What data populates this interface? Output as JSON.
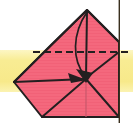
{
  "figure": {
    "width": 133,
    "height": 123,
    "background_color": "#ffffff",
    "caption": ""
  },
  "colors": {
    "paper_front": "#f4687d",
    "paper_front_shade": "#ef5b72",
    "paper_stripe": "#e85c72",
    "fold_line": "#231f20",
    "crease_dashed": "#231f20",
    "arrow": "#231f20",
    "highlight_band": "#f7e98a",
    "highlight_band_soft": "#faf0ab",
    "edge_rule": "#3a2f1e",
    "white": "#ffffff"
  },
  "highlight_band": {
    "name": "yellow-horizontal-band",
    "x": 0,
    "y": 50,
    "width": 133,
    "height": 42,
    "color": "#f7e98a"
  },
  "right_rule": {
    "name": "vertical-edge-rule",
    "x": 119,
    "y_top": 0,
    "y_bottom": 123,
    "color": "#3a2f1e",
    "width": 1.4
  },
  "paper": {
    "name": "folded-paper-body",
    "fill": "#f4687d",
    "stroke": "#231f20",
    "stroke_width": 2,
    "points": "87,10 119,42 119,117 42,117 14,82 51,45"
  },
  "fold_lines": [
    {
      "name": "crease-apex-to-left-vertex",
      "style": "solid",
      "points": "87,10 14,82"
    },
    {
      "name": "crease-apex-to-right-edge",
      "style": "solid",
      "points": "87,10 119,42"
    },
    {
      "name": "crease-apex-vertical-to-center",
      "style": "solid",
      "points": "87,11 86,78"
    },
    {
      "name": "crease-left-vertex-to-center",
      "style": "solid",
      "points": "14,82 86,79"
    },
    {
      "name": "crease-center-to-right-upper",
      "style": "solid",
      "points": "86,78 119,52"
    },
    {
      "name": "crease-center-to-bottom-left",
      "style": "solid",
      "points": "86,79 42,117"
    },
    {
      "name": "crease-center-to-bottom-right",
      "style": "solid",
      "points": "86,79 119,117"
    },
    {
      "name": "crease-center-vertical-to-bottom",
      "style": "solid-light",
      "points": "86,80 86,117"
    }
  ],
  "dashed_crease": {
    "name": "valley-fold-dashed-line",
    "style": "dashed",
    "points": "33,52 129,52",
    "dash_pattern": "7 4"
  },
  "motion_arc": {
    "name": "fold-motion-curved-arrow",
    "path": "M 87,12 C 72,34 72,60 85,76",
    "stroke": "#231f20",
    "stroke_width": 1.6
  },
  "arrowheads": [
    {
      "name": "arrowhead-fold-target",
      "points": "86,82 76,70 92,72",
      "fill": "#231f20"
    },
    {
      "name": "arrowhead-left-crease",
      "points": "86,79 70,74 72,82",
      "fill": "#231f20"
    }
  ],
  "annotations": {
    "legend": [],
    "labels": []
  }
}
